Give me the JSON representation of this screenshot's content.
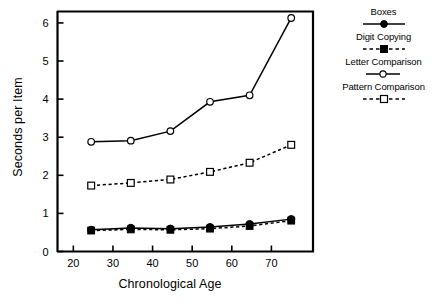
{
  "chart_data": {
    "type": "line",
    "title": "",
    "xlabel": "Chronological Age",
    "ylabel": "Seconds per Item",
    "xlim": [
      16,
      80.5
    ],
    "ylim": [
      0,
      6.3
    ],
    "xticks": [
      20,
      30,
      40,
      50,
      60,
      70
    ],
    "yticks": [
      0,
      1,
      2,
      3,
      4,
      5,
      6
    ],
    "grid": false,
    "legend_position": "right-outside",
    "x": [
      24.5,
      34.5,
      44.5,
      54.5,
      64.5,
      75
    ],
    "series": [
      {
        "name": "Boxes",
        "values": [
          0.57,
          0.62,
          0.6,
          0.64,
          0.72,
          0.85
        ],
        "line": "solid",
        "marker": "filled-circle",
        "color": "#000000"
      },
      {
        "name": "Digit Copying",
        "values": [
          0.55,
          0.58,
          0.57,
          0.6,
          0.67,
          0.81
        ],
        "line": "dashed",
        "marker": "filled-square",
        "color": "#000000"
      },
      {
        "name": "Letter Comparison",
        "values": [
          2.88,
          2.91,
          3.16,
          3.93,
          4.1,
          6.13
        ],
        "line": "solid",
        "marker": "open-circle",
        "color": "#000000"
      },
      {
        "name": "Pattern Comparison",
        "values": [
          1.73,
          1.8,
          1.89,
          2.09,
          2.33,
          2.8
        ],
        "line": "dashed",
        "marker": "open-square",
        "color": "#000000"
      }
    ]
  },
  "legend": {
    "entries": [
      {
        "label": "Boxes",
        "swatch": "solid-line-filled-circle"
      },
      {
        "label": "Digit Copying",
        "swatch": "dashed-line-filled-square"
      },
      {
        "label": "Letter Comparison",
        "swatch": "solid-line-open-circle"
      },
      {
        "label": "Pattern Comparison",
        "swatch": "dashed-line-open-square"
      }
    ]
  },
  "axes": {
    "x_title": "Chronological Age",
    "y_title": "Seconds per Item",
    "x_tick_labels": [
      "20",
      "30",
      "40",
      "50",
      "60",
      "70"
    ],
    "y_tick_labels": [
      "0",
      "1",
      "2",
      "3",
      "4",
      "5",
      "6"
    ]
  }
}
